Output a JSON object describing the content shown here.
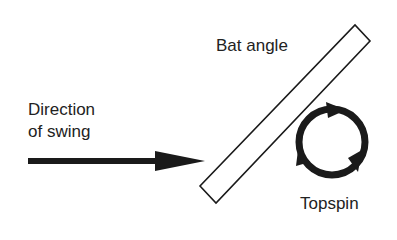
{
  "labels": {
    "direction_line1": "Direction",
    "direction_line2": "of swing",
    "bat_angle": "Bat angle",
    "topspin": "Topspin"
  },
  "colors": {
    "ink": "#1a1a1a",
    "background": "#ffffff"
  }
}
